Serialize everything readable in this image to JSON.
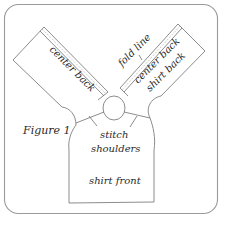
{
  "figure": {
    "caption": "Figure 1",
    "labels": {
      "left_panel": "center back",
      "fold_line": "fold line",
      "right_panel_line1": "center back",
      "right_panel_line2": "shirt back",
      "stitch_line1": "stitch",
      "stitch_line2": "shoulders",
      "front": "shirt front"
    },
    "colors": {
      "outline": "#6e6e6e",
      "frame": "#9a9a9a",
      "text": "#2a2a2a",
      "background": "#ffffff"
    }
  }
}
